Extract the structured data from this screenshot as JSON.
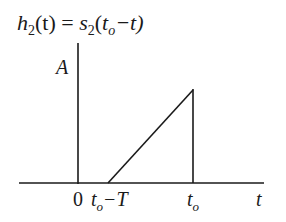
{
  "title": {
    "h": "h",
    "h_sub": "2",
    "lhs_arg": "(t) = ",
    "s": "s",
    "s_sub": "2",
    "open": "(",
    "t1": "t",
    "t1_sub": "o",
    "minus_t": "−t)"
  },
  "axis": {
    "y_label": "A",
    "x_label": "t",
    "ticks": {
      "zero": "0",
      "start_t": "t",
      "start_sub": "o",
      "start_rest": "−T",
      "end_t": "t",
      "end_sub": "o"
    }
  },
  "signal": {
    "description": "ramp from t_o - T rising to amplitude A at t_o, then dropping to zero",
    "points": [
      [
        "t_o-T",
        0
      ],
      [
        "t_o",
        "A"
      ],
      [
        "t_o",
        0
      ]
    ]
  }
}
